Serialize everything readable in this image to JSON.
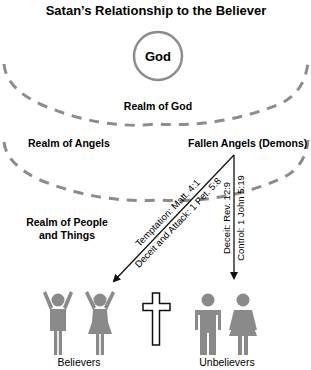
{
  "title": "Satan’s Relationship to the Believer",
  "god_label": "God",
  "realms": {
    "god": "Realm of God",
    "angels": "Realm of Angels",
    "fallen_angels": "Fallen Angels (Demons)",
    "people_line1": "Realm of People",
    "people_line2": "and Things"
  },
  "arrows": {
    "to_believers": [
      "Temptation: Matt. 4:1",
      "Deceit and Attack: 1 Pet. 5:8"
    ],
    "to_unbelievers": [
      "Deceit: Rev. 12:9",
      "Control: 1 John 5:19"
    ]
  },
  "groups": {
    "believers": "Believers",
    "unbelievers": "Unbelievers"
  },
  "icons": {
    "center": "cross-icon",
    "believers": [
      "raised-arms-man-icon",
      "raised-arms-woman-icon"
    ],
    "unbelievers": [
      "man-icon",
      "woman-icon"
    ]
  },
  "colors": {
    "arc": "#8c8c8c",
    "figure": "#8a8a8a",
    "text": "#1a1a1a",
    "circle": "#8c8c8c"
  }
}
